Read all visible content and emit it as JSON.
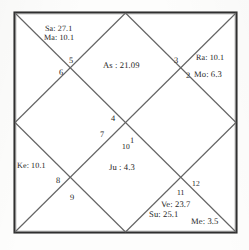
{
  "chart": {
    "type": "north-indian-vedic-birth-chart",
    "frame_color": "#2c2c2c",
    "line_color": "#5a5a5a",
    "background_color": "#fdfdfc",
    "text_color": "#262626"
  },
  "houses": [
    {
      "number": "1",
      "x": 130,
      "y": 137
    },
    {
      "number": "2",
      "x": 186,
      "y": 72
    },
    {
      "number": "3",
      "x": 174,
      "y": 57
    },
    {
      "number": "4",
      "x": 111,
      "y": 115
    },
    {
      "number": "5",
      "x": 69,
      "y": 57
    },
    {
      "number": "6",
      "x": 59,
      "y": 69
    },
    {
      "number": "7",
      "x": 100,
      "y": 131
    },
    {
      "number": "8",
      "x": 56,
      "y": 177
    },
    {
      "number": "9",
      "x": 70,
      "y": 194
    },
    {
      "number": "10",
      "x": 122,
      "y": 143
    },
    {
      "number": "11",
      "x": 177,
      "y": 189
    },
    {
      "number": "12",
      "x": 192,
      "y": 180
    }
  ],
  "readings": [
    {
      "name": "Sa",
      "label": "Sa: 27.1",
      "x": 45,
      "y": 25,
      "size": "normal"
    },
    {
      "name": "Ma",
      "label": "Ma: 10.1",
      "x": 44,
      "y": 34,
      "size": "normal"
    },
    {
      "name": "As",
      "label": "As : 21.09",
      "x": 103,
      "y": 61,
      "size": "big"
    },
    {
      "name": "Ra",
      "label": "Ra: 10.1",
      "x": 196,
      "y": 54,
      "size": "normal"
    },
    {
      "name": "Mo",
      "label": "Mo: 6.3",
      "x": 194,
      "y": 70,
      "size": "big"
    },
    {
      "name": "Ke",
      "label": "Ke: 10.1",
      "x": 17,
      "y": 162,
      "size": "normal"
    },
    {
      "name": "Ju",
      "label": "Ju : 4.3",
      "x": 109,
      "y": 163,
      "size": "big"
    },
    {
      "name": "Ve",
      "label": "Ve: 23.7",
      "x": 161,
      "y": 200,
      "size": "big"
    },
    {
      "name": "Su",
      "label": "Su: 25.1",
      "x": 149,
      "y": 210,
      "size": "big"
    },
    {
      "name": "Me",
      "label": "Me: 3.5",
      "x": 191,
      "y": 217,
      "size": "big"
    }
  ],
  "chart_data": {
    "type": "table",
    "house_numbers": [
      "1",
      "2",
      "3",
      "4",
      "5",
      "6",
      "7",
      "8",
      "9",
      "10",
      "11",
      "12"
    ],
    "planet_abbreviations": {
      "As": "Ascendant",
      "Su": "Sun",
      "Mo": "Moon",
      "Ma": "Mars",
      "Me": "Mercury",
      "Ju": "Jupiter",
      "Ve": "Venus",
      "Sa": "Saturn",
      "Ra": "Rahu",
      "Ke": "Ketu"
    },
    "placements": [
      {
        "body": "Sa",
        "degree": 27.1,
        "text": "Sa: 27.1"
      },
      {
        "body": "Ma",
        "degree": 10.1,
        "text": "Ma: 10.1"
      },
      {
        "body": "As",
        "degree": 21.09,
        "text": "As : 21.09"
      },
      {
        "body": "Ra",
        "degree": 10.1,
        "text": "Ra: 10.1"
      },
      {
        "body": "Mo",
        "degree": 6.3,
        "text": "Mo: 6.3"
      },
      {
        "body": "Ke",
        "degree": 10.1,
        "text": "Ke: 10.1"
      },
      {
        "body": "Ju",
        "degree": 4.3,
        "text": "Ju : 4.3"
      },
      {
        "body": "Ve",
        "degree": 23.7,
        "text": "Ve: 23.7"
      },
      {
        "body": "Su",
        "degree": 25.1,
        "text": "Su: 25.1"
      },
      {
        "body": "Me",
        "degree": 3.5,
        "text": "Me: 3.5"
      }
    ]
  }
}
